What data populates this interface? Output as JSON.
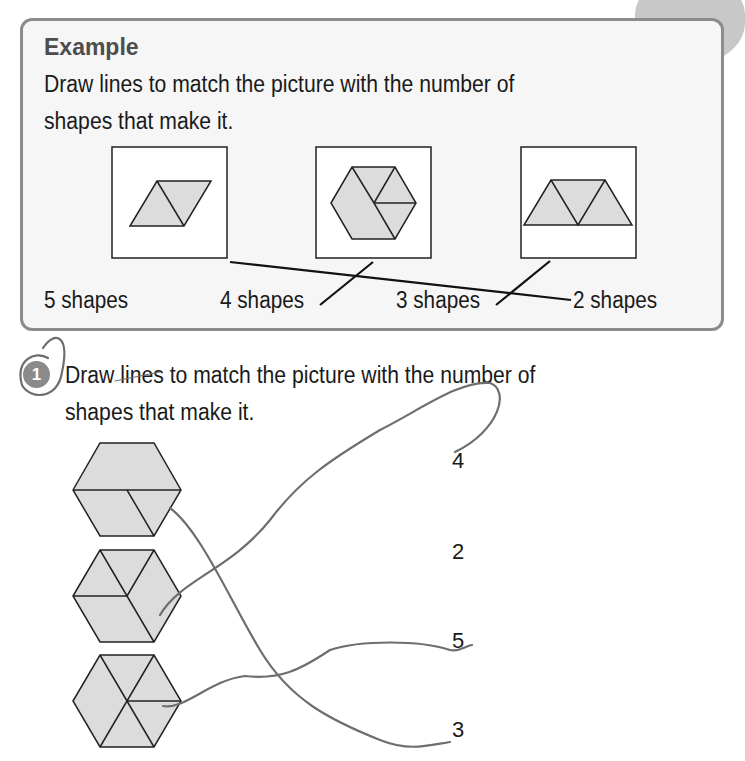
{
  "example": {
    "title": "Example",
    "instruction_line1": "Draw lines to match the picture with the number of",
    "instruction_line2": "shapes that make it.",
    "pictures": [
      {
        "id": "rhombus",
        "description": "2 triangles forming a parallelogram"
      },
      {
        "id": "hexagon",
        "description": "hexagon made of trapezoid, rhombus and triangles"
      },
      {
        "id": "trapezoid",
        "description": "3 triangles forming a trapezoid"
      }
    ],
    "labels": [
      "5 shapes",
      "4 shapes",
      "3 shapes",
      "2 shapes"
    ],
    "matches": [
      {
        "picture": "rhombus",
        "label": "2 shapes"
      },
      {
        "picture": "hexagon",
        "label": "4 shapes"
      },
      {
        "picture": "trapezoid",
        "label": "3 shapes"
      }
    ]
  },
  "question": {
    "number": "1",
    "instruction_line1": "Draw lines to match the picture with the number of",
    "instruction_line2": "shapes that make it.",
    "hexagons": [
      {
        "id": "hex-1",
        "description": "trapezoid + rhombus + triangle"
      },
      {
        "id": "hex-2",
        "description": "3 rhombi/triangles split"
      },
      {
        "id": "hex-3",
        "description": "6 triangles variant"
      }
    ],
    "numbers": [
      "4",
      "2",
      "5",
      "3"
    ],
    "student_answers": [
      {
        "hexagon": "hex-1",
        "number": "3"
      },
      {
        "hexagon": "hex-2",
        "number": "4"
      },
      {
        "hexagon": "hex-3",
        "number": "5"
      }
    ]
  },
  "colors": {
    "shape_fill": "#dcdcdc",
    "box_border": "#8c8c8c",
    "pencil": "#6e6e6e"
  }
}
